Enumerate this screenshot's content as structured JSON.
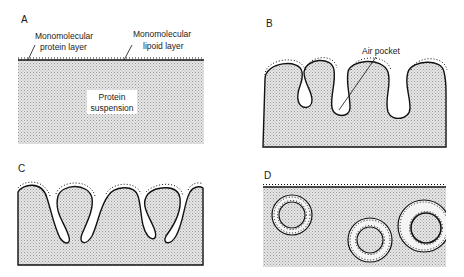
{
  "figure": {
    "panels": [
      {
        "id": "A",
        "label": "A",
        "annotations": {
          "protein_layer": [
            "Monomolecular",
            "protein layer"
          ],
          "lipoid_layer": [
            "Monomolecular",
            "lipoid layer"
          ],
          "suspension": [
            "Protein",
            "suspension"
          ]
        }
      },
      {
        "id": "B",
        "label": "B",
        "annotations": {
          "air_pocket": "Air pocket"
        }
      },
      {
        "id": "C",
        "label": "C"
      },
      {
        "id": "D",
        "label": "D"
      }
    ],
    "colors": {
      "fill": "#cfcfcf",
      "line": "#111111",
      "background": "#ffffff"
    }
  }
}
